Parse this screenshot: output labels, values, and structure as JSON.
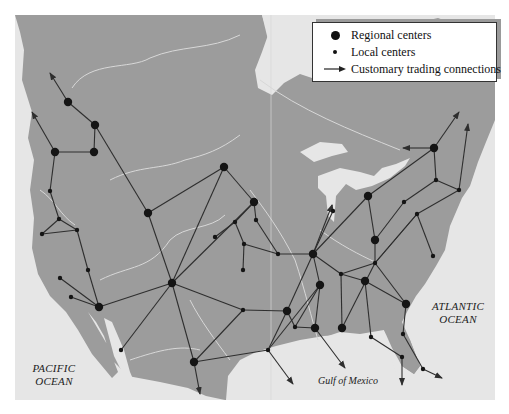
{
  "legend": {
    "items": [
      {
        "symbol": "large-dot",
        "label": "Regional centers"
      },
      {
        "symbol": "small-dot",
        "label": "Local centers"
      },
      {
        "symbol": "arrow",
        "label": "Customary trading connections"
      }
    ]
  },
  "labels": {
    "pacific_line1": "PACIFIC",
    "pacific_line2": "OCEAN",
    "atlantic_line1": "ATLANTIC",
    "atlantic_line2": "OCEAN",
    "gulf": "Gulf of Mexico"
  },
  "colors": {
    "land": "#9c9c9c",
    "water": "#e6e6e6",
    "rivers": "#d8d8d8",
    "lines": "#2e2e2e",
    "nodes": "#151515"
  },
  "nodes": [
    {
      "id": "n1",
      "x": 68,
      "y": 102,
      "type": "regional"
    },
    {
      "id": "n2",
      "x": 95,
      "y": 125,
      "type": "regional"
    },
    {
      "id": "n3",
      "x": 55,
      "y": 152,
      "type": "regional"
    },
    {
      "id": "n4",
      "x": 94,
      "y": 152,
      "type": "regional"
    },
    {
      "id": "n5",
      "x": 50,
      "y": 191,
      "type": "local"
    },
    {
      "id": "n6",
      "x": 59,
      "y": 219,
      "type": "local"
    },
    {
      "id": "n7",
      "x": 42,
      "y": 234,
      "type": "local"
    },
    {
      "id": "n8",
      "x": 77,
      "y": 230,
      "type": "local"
    },
    {
      "id": "n9",
      "x": 88,
      "y": 270,
      "type": "local"
    },
    {
      "id": "n10",
      "x": 60,
      "y": 278,
      "type": "local"
    },
    {
      "id": "n11",
      "x": 71,
      "y": 297,
      "type": "local"
    },
    {
      "id": "n12",
      "x": 99,
      "y": 307,
      "type": "regional"
    },
    {
      "id": "n13",
      "x": 148,
      "y": 213,
      "type": "regional"
    },
    {
      "id": "n14",
      "x": 172,
      "y": 283,
      "type": "regional"
    },
    {
      "id": "n15",
      "x": 121,
      "y": 350,
      "type": "local"
    },
    {
      "id": "n16",
      "x": 224,
      "y": 167,
      "type": "regional"
    },
    {
      "id": "n17",
      "x": 254,
      "y": 202,
      "type": "regional"
    },
    {
      "id": "n18",
      "x": 235,
      "y": 222,
      "type": "local"
    },
    {
      "id": "n19",
      "x": 256,
      "y": 220,
      "type": "local"
    },
    {
      "id": "n20",
      "x": 215,
      "y": 237,
      "type": "local"
    },
    {
      "id": "n21",
      "x": 244,
      "y": 244,
      "type": "local"
    },
    {
      "id": "n22",
      "x": 243,
      "y": 270,
      "type": "local"
    },
    {
      "id": "n23",
      "x": 278,
      "y": 254,
      "type": "local"
    },
    {
      "id": "n24",
      "x": 313,
      "y": 254,
      "type": "regional"
    },
    {
      "id": "n25",
      "x": 320,
      "y": 285,
      "type": "regional"
    },
    {
      "id": "n26",
      "x": 341,
      "y": 274,
      "type": "local"
    },
    {
      "id": "n27",
      "x": 365,
      "y": 281,
      "type": "regional"
    },
    {
      "id": "n28",
      "x": 375,
      "y": 263,
      "type": "local"
    },
    {
      "id": "n29",
      "x": 375,
      "y": 240,
      "type": "regional"
    },
    {
      "id": "n30",
      "x": 333,
      "y": 211,
      "type": "local"
    },
    {
      "id": "n31",
      "x": 368,
      "y": 196,
      "type": "regional"
    },
    {
      "id": "n32",
      "x": 404,
      "y": 202,
      "type": "local"
    },
    {
      "id": "n33",
      "x": 417,
      "y": 214,
      "type": "local"
    },
    {
      "id": "n34",
      "x": 433,
      "y": 256,
      "type": "local"
    },
    {
      "id": "n35",
      "x": 436,
      "y": 180,
      "type": "local"
    },
    {
      "id": "n36",
      "x": 459,
      "y": 190,
      "type": "local"
    },
    {
      "id": "n37",
      "x": 434,
      "y": 148,
      "type": "regional"
    },
    {
      "id": "n38",
      "x": 406,
      "y": 304,
      "type": "regional"
    },
    {
      "id": "n39",
      "x": 403,
      "y": 334,
      "type": "local"
    },
    {
      "id": "n40",
      "x": 371,
      "y": 337,
      "type": "local"
    },
    {
      "id": "n41",
      "x": 402,
      "y": 357,
      "type": "local"
    },
    {
      "id": "n42",
      "x": 423,
      "y": 369,
      "type": "local"
    },
    {
      "id": "n43",
      "x": 243,
      "y": 310,
      "type": "local"
    },
    {
      "id": "n44",
      "x": 287,
      "y": 311,
      "type": "regional"
    },
    {
      "id": "n45",
      "x": 295,
      "y": 327,
      "type": "local"
    },
    {
      "id": "n46",
      "x": 315,
      "y": 328,
      "type": "regional"
    },
    {
      "id": "n47",
      "x": 342,
      "y": 328,
      "type": "regional"
    },
    {
      "id": "n48",
      "x": 268,
      "y": 350,
      "type": "local"
    },
    {
      "id": "n49",
      "x": 194,
      "y": 362,
      "type": "regional"
    }
  ],
  "edges": [
    [
      68,
      102,
      95,
      125
    ],
    [
      95,
      125,
      94,
      152
    ],
    [
      55,
      152,
      94,
      152
    ],
    [
      95,
      125,
      148,
      213
    ],
    [
      55,
      152,
      50,
      191
    ],
    [
      50,
      191,
      59,
      219
    ],
    [
      59,
      219,
      42,
      234
    ],
    [
      59,
      219,
      77,
      230
    ],
    [
      42,
      234,
      77,
      230
    ],
    [
      77,
      230,
      88,
      270
    ],
    [
      88,
      270,
      99,
      307
    ],
    [
      60,
      278,
      99,
      307
    ],
    [
      71,
      297,
      99,
      307
    ],
    [
      99,
      307,
      172,
      283
    ],
    [
      148,
      213,
      172,
      283
    ],
    [
      148,
      213,
      224,
      167
    ],
    [
      121,
      350,
      172,
      283
    ],
    [
      172,
      283,
      194,
      362
    ],
    [
      172,
      283,
      224,
      167
    ],
    [
      172,
      283,
      243,
      310
    ],
    [
      172,
      283,
      254,
      202
    ],
    [
      224,
      167,
      254,
      202
    ],
    [
      254,
      202,
      235,
      222
    ],
    [
      235,
      222,
      215,
      237
    ],
    [
      254,
      202,
      256,
      220
    ],
    [
      235,
      222,
      244,
      244
    ],
    [
      244,
      244,
      243,
      270
    ],
    [
      244,
      244,
      278,
      254
    ],
    [
      256,
      220,
      278,
      254
    ],
    [
      278,
      254,
      313,
      254
    ],
    [
      313,
      254,
      320,
      285
    ],
    [
      313,
      254,
      341,
      274
    ],
    [
      313,
      254,
      333,
      211
    ],
    [
      313,
      254,
      287,
      311
    ],
    [
      313,
      254,
      368,
      196
    ],
    [
      320,
      285,
      315,
      328
    ],
    [
      341,
      274,
      375,
      263
    ],
    [
      341,
      274,
      365,
      281
    ],
    [
      375,
      263,
      375,
      240
    ],
    [
      375,
      240,
      368,
      196
    ],
    [
      375,
      263,
      406,
      304
    ],
    [
      375,
      263,
      417,
      214
    ],
    [
      365,
      281,
      406,
      304
    ],
    [
      365,
      281,
      371,
      337
    ],
    [
      371,
      337,
      402,
      357
    ],
    [
      406,
      304,
      403,
      334
    ],
    [
      403,
      334,
      423,
      369
    ],
    [
      320,
      285,
      295,
      327
    ],
    [
      295,
      327,
      315,
      328
    ],
    [
      295,
      327,
      287,
      311
    ],
    [
      287,
      311,
      243,
      310
    ],
    [
      243,
      310,
      194,
      362
    ],
    [
      194,
      362,
      268,
      350
    ],
    [
      268,
      350,
      287,
      311
    ],
    [
      268,
      350,
      320,
      285
    ],
    [
      341,
      274,
      342,
      328
    ],
    [
      342,
      328,
      375,
      263
    ],
    [
      368,
      196,
      434,
      148
    ],
    [
      434,
      148,
      436,
      180
    ],
    [
      436,
      180,
      404,
      202
    ],
    [
      404,
      202,
      375,
      240
    ],
    [
      436,
      180,
      459,
      190
    ],
    [
      459,
      190,
      417,
      214
    ],
    [
      417,
      214,
      375,
      263
    ],
    [
      417,
      214,
      433,
      256
    ],
    [
      333,
      211,
      332,
      205
    ]
  ],
  "arrows": [
    [
      68,
      102,
      50,
      73
    ],
    [
      55,
      152,
      32,
      112
    ],
    [
      434,
      148,
      459,
      112
    ],
    [
      434,
      148,
      403,
      148
    ],
    [
      459,
      190,
      468,
      124
    ],
    [
      194,
      362,
      200,
      394
    ],
    [
      268,
      350,
      293,
      384
    ],
    [
      315,
      328,
      345,
      368
    ],
    [
      402,
      357,
      402,
      385
    ],
    [
      423,
      369,
      442,
      378
    ],
    [
      313,
      254,
      332,
      205
    ]
  ]
}
